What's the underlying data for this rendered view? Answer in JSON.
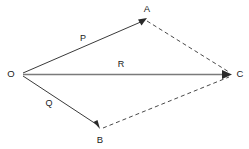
{
  "diagram": {
    "background_color": "#ffffff",
    "vertices": [
      {
        "id": "O",
        "label": "O",
        "x": 22,
        "y": 74,
        "label_x": 11,
        "label_y": 74
      },
      {
        "id": "A",
        "label": "A",
        "x": 146,
        "y": 19,
        "label_x": 147,
        "label_y": 9
      },
      {
        "id": "B",
        "label": "B",
        "x": 99,
        "y": 128,
        "label_x": 100,
        "label_y": 139
      },
      {
        "id": "C",
        "label": "C",
        "x": 231,
        "y": 74,
        "label_x": 240,
        "label_y": 74
      }
    ],
    "vectors": [
      {
        "id": "P",
        "label": "P",
        "from": "O",
        "to": "A",
        "style": "solid",
        "color": "#3a3a3a",
        "label_x": 83,
        "label_y": 39
      },
      {
        "id": "Q",
        "label": "Q",
        "from": "O",
        "to": "B",
        "style": "solid",
        "color": "#3a3a3a",
        "label_x": 49,
        "label_y": 104
      },
      {
        "id": "R",
        "label": "R",
        "from": "O",
        "to": "C",
        "style": "solid",
        "color": "#7a7a7a",
        "label_x": 121,
        "label_y": 65
      }
    ],
    "construction_lines": [
      {
        "id": "AC",
        "from": "A",
        "to": "C",
        "style": "dashed",
        "color": "#4a4a4a"
      },
      {
        "id": "BC",
        "from": "B",
        "to": "C",
        "style": "dashed",
        "color": "#4a4a4a"
      }
    ]
  }
}
